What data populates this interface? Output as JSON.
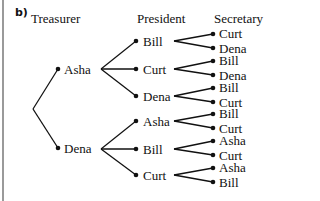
{
  "part_label": "b)",
  "headers": {
    "treasurer": "Treasurer",
    "president": "President",
    "secretary": "Secretary"
  },
  "tree": {
    "treasurers": [
      {
        "name": "Asha",
        "presidents": [
          {
            "name": "Bill",
            "secretaries": [
              "Curt",
              "Dena"
            ]
          },
          {
            "name": "Curt",
            "secretaries": [
              "Bill",
              "Dena"
            ]
          },
          {
            "name": "Dena",
            "secretaries": [
              "Bill",
              "Curt"
            ]
          }
        ]
      },
      {
        "name": "Dena",
        "presidents": [
          {
            "name": "Asha",
            "secretaries": [
              "Bill",
              "Curt"
            ]
          },
          {
            "name": "Bill",
            "secretaries": [
              "Asha",
              "Curt"
            ]
          },
          {
            "name": "Curt",
            "secretaries": [
              "Asha",
              "Bill"
            ]
          }
        ]
      }
    ]
  },
  "colors": {
    "line": "#111111",
    "frame": "#9a9a9a"
  }
}
